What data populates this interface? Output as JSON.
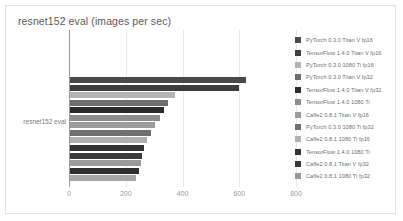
{
  "chart_data": {
    "type": "bar",
    "orientation": "horizontal",
    "title": "resnet152 eval (images per sec)",
    "xlabel": "",
    "ylabel": "",
    "categories": [
      "resnet152 eval"
    ],
    "xlim": [
      0,
      800
    ],
    "xticks": [
      0,
      200,
      400,
      600,
      800
    ],
    "xtick_labels": [
      "0",
      "200",
      "400",
      "600",
      "800"
    ],
    "grid": true,
    "legend_position": "right",
    "series": [
      {
        "name": "PyTorch 0.3.0 Titan V fp16",
        "value": 620,
        "color": "#4a4a4a"
      },
      {
        "name": "TensorFlow 1.4.0 Titan V fp16",
        "value": 595,
        "color": "#3d3d3d"
      },
      {
        "name": "PyTorch 0.3.0 1080 Ti fp16",
        "value": 370,
        "color": "#b4b4b4"
      },
      {
        "name": "PyTorch 0.3.0 Titan V fp32",
        "value": 345,
        "color": "#6e6e6e"
      },
      {
        "name": "TensorFlow 1.4.0 Titan V fp32",
        "value": 330,
        "color": "#2b2b2b"
      },
      {
        "name": "TensorFlow 1.4.0 1080 Ti",
        "value": 318,
        "color": "#8d8d8d"
      },
      {
        "name": "Caffe2 0.8.1 Titan V fp16",
        "value": 300,
        "color": "#9d9d9d"
      },
      {
        "name": "PyTorch 0.3.0 1080 Ti fp32",
        "value": 285,
        "color": "#707070"
      },
      {
        "name": "Caffe2 0.8.1 1080 Ti fp16",
        "value": 272,
        "color": "#b0b0b0"
      },
      {
        "name": "TensorFlow 1.4.0 1080 Ti",
        "value": 262,
        "color": "#333333"
      },
      {
        "name": "Caffe2 0.8.1 Titan V fp32",
        "value": 255,
        "color": "#3a3a3a"
      },
      {
        "name": "Caffe2 0.8.1 1080 Ti fp32",
        "value": 250,
        "color": "#9a9a9a"
      },
      {
        "name": "Caffe2 0.8.1 Titan V fp32 b",
        "value": 243,
        "color": "#2f2f2f"
      },
      {
        "name": "Caffe2 0.8.1 1080 Ti fp32 b",
        "value": 232,
        "color": "#a6a6a6"
      }
    ],
    "legend_labels": [
      "PyTorch 0.3.0 Titan V fp16",
      "TensorFlow 1.4.0 Titan V fp16",
      "PyTorch 0.3.0 1080 Ti fp16",
      "PyTorch 0.3.0 Titan V fp32",
      "TensorFlow 1.4.0 Titan V fp32",
      "TensorFlow 1.4.0 1080 Ti",
      "Caffe2 0.8.1 Titan V fp16",
      "PyTorch 0.3.0 1080 Ti fp32",
      "Caffe2 0.8.1 1080 Ti fp16",
      "TensorFlow 1.4.0 1080 Ti",
      "Caffe2 0.8.1 Titan V fp32",
      "Caffe2 0.8.1 1080 Ti fp32"
    ]
  }
}
